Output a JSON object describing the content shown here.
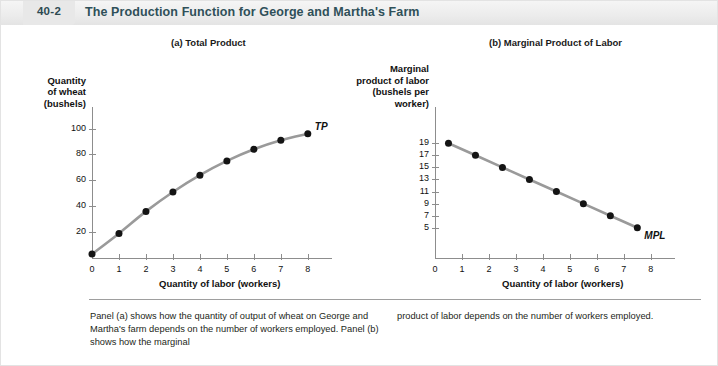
{
  "figure": {
    "word": "FIGURE",
    "number": "40-2",
    "title": "The Production Function for George and Martha's Farm"
  },
  "panels": {
    "a": {
      "title": "(a) Total Product"
    },
    "b": {
      "title": "(b) Marginal Product of Labor"
    }
  },
  "caption": {
    "left": "Panel (a) shows how the quantity of output of wheat on George and Martha's farm depends on the number of workers employed. Panel (b) shows how the marginal",
    "right": "product of labor depends on the number of workers employed."
  },
  "colors": {
    "curve": "#9a9a9a",
    "marker": "#141414",
    "axis": "#8d8d8d",
    "title": "#2f5059",
    "header_bg": "#ececec"
  },
  "chart_data": [
    {
      "type": "line",
      "title": "(a) Total Product",
      "xlabel": "Quantity of labor (workers)",
      "ylabel": "Quantity of wheat (bushels)",
      "ylabel_lines": [
        "Quantity",
        "of wheat",
        "(bushels)"
      ],
      "series_label": "TP",
      "x": [
        0,
        1,
        2,
        3,
        4,
        5,
        6,
        7,
        8
      ],
      "values": [
        3,
        19,
        36,
        51,
        64,
        75,
        84,
        91,
        96
      ],
      "xticks": [
        0,
        1,
        2,
        3,
        4,
        5,
        6,
        7,
        8
      ],
      "xtick_labels": [
        "0",
        "1",
        "2",
        "3",
        "4",
        "5",
        "6",
        "7",
        "8"
      ],
      "yticks": [
        20,
        40,
        60,
        80,
        100
      ],
      "ytick_labels": [
        "20",
        "40",
        "60",
        "80",
        "100"
      ],
      "xlim": [
        0,
        8.6
      ],
      "ylim": [
        0,
        112
      ],
      "grid": false,
      "markers": true
    },
    {
      "type": "line",
      "title": "(b) Marginal Product of Labor",
      "xlabel": "Quantity of labor (workers)",
      "ylabel": "Marginal product of labor (bushels per worker)",
      "ylabel_lines": [
        "Marginal",
        "product of labor",
        "(bushels per",
        "worker)"
      ],
      "series_label": "MPL",
      "x": [
        0.5,
        1.5,
        2.5,
        3.5,
        4.5,
        5.5,
        6.5,
        7.5
      ],
      "values": [
        19,
        17,
        15,
        13,
        11,
        9,
        7,
        5
      ],
      "xticks": [
        0,
        1,
        2,
        3,
        4,
        5,
        6,
        7,
        8
      ],
      "xtick_labels": [
        "0",
        "1",
        "2",
        "3",
        "4",
        "5",
        "6",
        "7",
        "8"
      ],
      "yticks": [
        5,
        7,
        9,
        11,
        13,
        15,
        17,
        19
      ],
      "ytick_labels": [
        "5",
        "7",
        "9",
        "11",
        "13",
        "15",
        "17",
        "19"
      ],
      "xlim": [
        0,
        8.6
      ],
      "ylim": [
        0,
        24
      ],
      "grid": false,
      "markers": true
    }
  ]
}
